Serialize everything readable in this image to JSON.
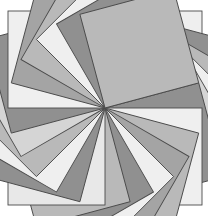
{
  "figure": {
    "background_color": "#ffffff",
    "canvas": {
      "width": 208,
      "height": 216
    },
    "center": {
      "x": 105,
      "y": 108
    },
    "square_size": 97,
    "count": 24,
    "angle_step_deg": 15,
    "start_angle_deg": 0,
    "rotation_direction": "clockwise",
    "stroke_color": "#4a4a4a",
    "stroke_width": 0.9,
    "palette": [
      "#efefef",
      "#b9b9b9",
      "#909090",
      "#d5d5d5",
      "#a4a4a4",
      "#e8e8e8"
    ],
    "shade_sequence": [
      0,
      2,
      1,
      0,
      3,
      2,
      0,
      1,
      4,
      0,
      2,
      1,
      5,
      2,
      0,
      1,
      3,
      2,
      0,
      4,
      1,
      0,
      2,
      1
    ],
    "labels": {
      "canvas_name": "rosette-figure",
      "shape_name": "square-petal"
    }
  }
}
